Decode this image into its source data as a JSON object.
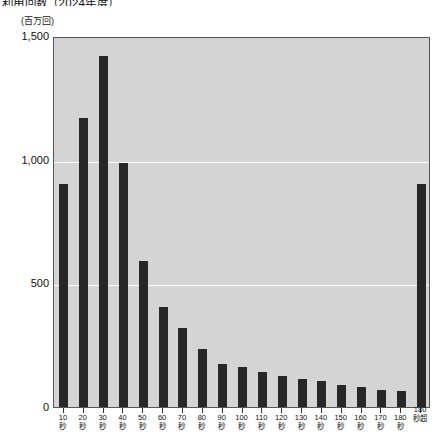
{
  "figure": {
    "title": "利用回数（2024年度）",
    "y_axis_unit": "(百万回)"
  },
  "chart_data": {
    "type": "bar",
    "title": "利用回数（2024年度）",
    "subtitle": "",
    "xlabel": "",
    "ylabel": "(百万回)",
    "ylim": [
      0,
      1500
    ],
    "yticks": [
      0,
      500,
      1000,
      1500
    ],
    "ytick_labels": [
      "0",
      "500",
      "1,000",
      "1,500"
    ],
    "grid": true,
    "grid_axis": "y",
    "legend": false,
    "legend_position": "none",
    "bar_color": "#272727",
    "plot_background": "#d4d4d4",
    "categories": [
      "10秒",
      "20秒",
      "30秒",
      "40秒",
      "50秒",
      "60秒",
      "70秒",
      "80秒",
      "90秒",
      "100秒",
      "110秒",
      "120秒",
      "130秒",
      "140秒",
      "150秒",
      "160秒",
      "170秒",
      "180秒",
      "180秒超"
    ],
    "category_numbers": [
      "10",
      "20",
      "30",
      "40",
      "50",
      "60",
      "70",
      "80",
      "90",
      "100",
      "110",
      "120",
      "130",
      "140",
      "150",
      "160",
      "170",
      "180",
      "180"
    ],
    "category_units": [
      "秒",
      "秒",
      "秒",
      "秒",
      "秒",
      "秒",
      "秒",
      "秒",
      "秒",
      "秒",
      "秒",
      "秒",
      "秒",
      "秒",
      "秒",
      "秒",
      "秒",
      "秒",
      "秒超"
    ],
    "values": [
      900,
      1170,
      1420,
      985,
      590,
      405,
      320,
      235,
      175,
      160,
      140,
      125,
      115,
      105,
      90,
      80,
      70,
      65,
      900
    ],
    "annotations": []
  }
}
